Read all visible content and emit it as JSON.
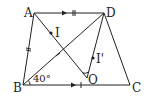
{
  "diagram": {
    "type": "geometry-trapezoid",
    "points": {
      "A": {
        "label": "A",
        "x": 34,
        "y": 13
      },
      "D": {
        "label": "D",
        "x": 104,
        "y": 13
      },
      "B": {
        "label": "B",
        "x": 23,
        "y": 85
      },
      "C": {
        "label": "C",
        "x": 130,
        "y": 85
      },
      "O": {
        "label": "O",
        "x": 87,
        "y": 78
      },
      "I": {
        "label": "I",
        "x": 51,
        "y": 33
      },
      "I2": {
        "label": "I'",
        "x": 93,
        "y": 58
      }
    },
    "angle_label": "40°",
    "stroke_color": "#222222",
    "background": "#ffffff"
  }
}
